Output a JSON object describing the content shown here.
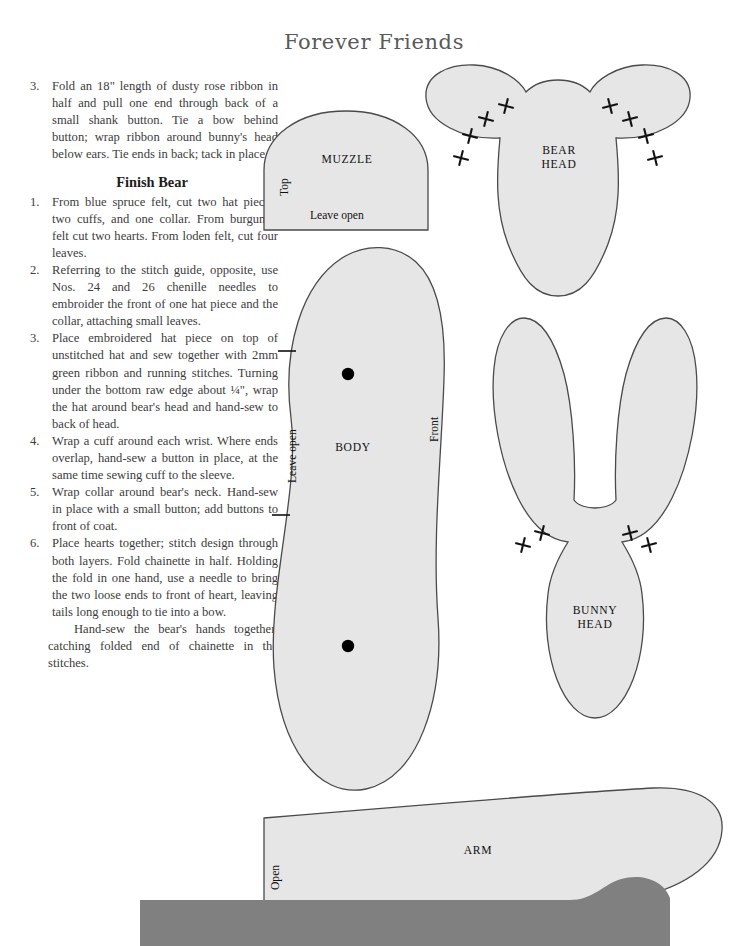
{
  "page": {
    "title": "Forever Friends",
    "background_color": "#ffffff",
    "text_color": "#3c3c3c"
  },
  "instructions": {
    "continued_step": {
      "number": "3.",
      "text": "Fold an 18\" length of dusty rose ribbon in half and pull one end through back of a small shank button. Tie a bow behind button; wrap ribbon around bunny's head below ears. Tie ends  in back; tack in place."
    },
    "section_heading": "Finish Bear",
    "steps": [
      {
        "number": "1.",
        "text": "From blue spruce felt, cut two hat pieces, two cuffs, and one collar. From burgundy felt cut two hearts. From loden felt, cut four leaves."
      },
      {
        "number": "2.",
        "text": "Referring to the stitch guide, opposite, use Nos. 24 and 26 chenille needles to embroider the front of one hat piece and the collar, attaching small leaves."
      },
      {
        "number": "3.",
        "text": "Place embroidered hat piece on top of unstitched hat and sew together with 2mm green ribbon and running stitches. Turning under the bottom raw edge about ¼\", wrap the hat around bear's head and hand-sew to back of head."
      },
      {
        "number": "4.",
        "text": "Wrap a cuff around each wrist. Where ends overlap, hand-sew a button in place, at the same time sewing cuff to the sleeve."
      },
      {
        "number": "5.",
        "text": "Wrap collar around bear's neck. Hand-sew in place with a small button; add buttons to front of coat."
      },
      {
        "number": "6.",
        "text": "Place hearts together; stitch design through both layers. Fold chainette in half. Holding the fold in one hand, use a needle to bring the two loose ends to front of heart, leaving tails long enough to tie into a bow."
      }
    ],
    "closing_paragraph": "Hand-sew the bear's hands together, catching folded end of chainette in the stitches."
  },
  "patterns": {
    "fill_color": "#e6e6e6",
    "stroke_color": "#4a4a4a",
    "dark_fill_color": "#808080",
    "pieces": [
      {
        "id": "muzzle",
        "label": "MUZZLE",
        "edge_labels": {
          "left": "Top",
          "bottom": "Leave open"
        },
        "markings": []
      },
      {
        "id": "bear-head",
        "label": "BEAR\nHEAD",
        "edge_labels": {},
        "markings": [
          "cross",
          "cross",
          "cross",
          "cross",
          "cross",
          "cross",
          "cross",
          "cross"
        ]
      },
      {
        "id": "body",
        "label": "BODY",
        "edge_labels": {
          "left": "Leave open",
          "right": "Front"
        },
        "markings": [
          "dot",
          "dot",
          "tick",
          "tick"
        ]
      },
      {
        "id": "bunny-head",
        "label": "BUNNY\nHEAD",
        "edge_labels": {},
        "markings": [
          "cross",
          "cross",
          "cross",
          "cross"
        ]
      },
      {
        "id": "arm",
        "label": "ARM",
        "edge_labels": {
          "left": "Open"
        },
        "markings": []
      },
      {
        "id": "partial-piece-bottom",
        "label": "",
        "edge_labels": {},
        "markings": []
      }
    ]
  }
}
